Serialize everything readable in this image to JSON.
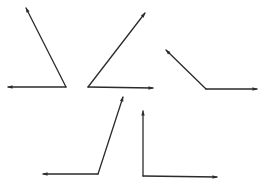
{
  "diagram": {
    "stroke_color": "#2b2b2b",
    "background": "#ffffff",
    "angles": [
      {
        "id": "angle-1",
        "label": "Acute angle opening up-left",
        "vertex": [
          66,
          87
        ],
        "rays": [
          [
            26,
            8
          ],
          [
            8,
            87
          ]
        ]
      },
      {
        "id": "angle-2",
        "label": "Acute angle opening up-right",
        "vertex": [
          88,
          87
        ],
        "rays": [
          [
            145,
            13
          ],
          [
            153,
            88
          ]
        ]
      },
      {
        "id": "angle-3",
        "label": "Obtuse angle",
        "vertex": [
          206,
          89
        ],
        "rays": [
          [
            166,
            50
          ],
          [
            257,
            89
          ]
        ]
      },
      {
        "id": "angle-4",
        "label": "Obtuse angle opening up-right",
        "vertex": [
          98,
          174
        ],
        "rays": [
          [
            123,
            97
          ],
          [
            43,
            174
          ]
        ]
      },
      {
        "id": "angle-5",
        "label": "Right angle",
        "vertex": [
          143,
          176
        ],
        "rays": [
          [
            143,
            111
          ],
          [
            217,
            177
          ]
        ]
      }
    ]
  }
}
